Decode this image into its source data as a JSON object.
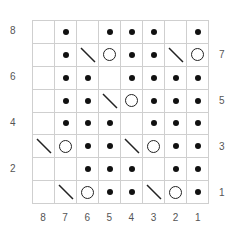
{
  "chart": {
    "type": "knitting-chart",
    "columns": 8,
    "rows": 8,
    "legend_symbols": {
      "dot": "purl",
      "circle": "yarn-over",
      "slash": "k2tog-decrease",
      "blank": "knit"
    },
    "grid_top_to_bottom": [
      [
        "",
        "dot",
        "",
        "dot",
        "dot",
        "dot",
        "",
        "dot"
      ],
      [
        "",
        "dot",
        "slash",
        "circle",
        "dot",
        "dot",
        "slash",
        "circle"
      ],
      [
        "",
        "dot",
        "dot",
        "",
        "dot",
        "dot",
        "dot",
        "dot"
      ],
      [
        "",
        "dot",
        "dot",
        "slash",
        "circle",
        "dot",
        "dot",
        "dot"
      ],
      [
        "",
        "dot",
        "dot",
        "dot",
        "",
        "dot",
        "dot",
        "dot"
      ],
      [
        "slash",
        "circle",
        "dot",
        "dot",
        "slash",
        "circle",
        "dot",
        "dot"
      ],
      [
        "",
        "",
        "dot",
        "dot",
        "dot",
        "",
        "dot",
        "dot"
      ],
      [
        "",
        "slash",
        "circle",
        "dot",
        "dot",
        "slash",
        "circle",
        "dot"
      ]
    ],
    "left_row_labels": [
      {
        "row": 0,
        "label": "8"
      },
      {
        "row": 2,
        "label": "6"
      },
      {
        "row": 4,
        "label": "4"
      },
      {
        "row": 6,
        "label": "2"
      }
    ],
    "right_row_labels": [
      {
        "row": 1,
        "label": "7"
      },
      {
        "row": 3,
        "label": "5"
      },
      {
        "row": 5,
        "label": "3"
      },
      {
        "row": 7,
        "label": "1"
      }
    ],
    "column_labels": [
      "8",
      "7",
      "6",
      "5",
      "4",
      "3",
      "2",
      "1"
    ]
  }
}
